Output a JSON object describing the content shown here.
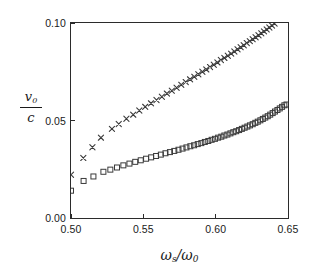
{
  "figure": {
    "background_color": "#ffffff",
    "frame_color": "#2b2b2b",
    "marker_color": "#3a3a3a"
  },
  "axes": {
    "ylabel_numerator": "v",
    "ylabel_numerator_sub": "0",
    "ylabel_denominator": "c",
    "xlabel_numerator": "ω",
    "xlabel_numerator_sub": "s",
    "xlabel_denominator": "ω",
    "xlabel_denominator_sub": "0",
    "xlabel_slash": "/",
    "ytick_labels": [
      "0.00",
      "0.05",
      "0.10"
    ],
    "xtick_labels": [
      "0.50",
      "0.55",
      "0.60",
      "0.65"
    ]
  },
  "chart_data": {
    "type": "scatter",
    "title": "",
    "xlabel": "ω_s/ω_0",
    "ylabel": "v_0/c",
    "xlim": [
      0.5,
      0.65
    ],
    "ylim": [
      0.0,
      0.1
    ],
    "xticks": [
      0.5,
      0.55,
      0.6,
      0.65
    ],
    "yticks": [
      0.0,
      0.05,
      0.1
    ],
    "grid": false,
    "legend": "none",
    "series": [
      {
        "name": "cross-series",
        "marker": "x",
        "points": [
          [
            0.5,
            0.0222
          ],
          [
            0.5085,
            0.0308
          ],
          [
            0.5148,
            0.0363
          ],
          [
            0.5207,
            0.0412
          ],
          [
            0.5283,
            0.0457
          ],
          [
            0.533,
            0.0482
          ],
          [
            0.5383,
            0.0509
          ],
          [
            0.543,
            0.053
          ],
          [
            0.5472,
            0.0551
          ],
          [
            0.5513,
            0.057
          ],
          [
            0.5553,
            0.0588
          ],
          [
            0.5591,
            0.0605
          ],
          [
            0.5628,
            0.0622
          ],
          [
            0.5663,
            0.0638
          ],
          [
            0.5697,
            0.0653
          ],
          [
            0.573,
            0.0668
          ],
          [
            0.5762,
            0.0683
          ],
          [
            0.5793,
            0.0697
          ],
          [
            0.5823,
            0.0711
          ],
          [
            0.5852,
            0.0724
          ],
          [
            0.588,
            0.0737
          ],
          [
            0.5908,
            0.075
          ],
          [
            0.5935,
            0.0762
          ],
          [
            0.5961,
            0.0774
          ],
          [
            0.5987,
            0.0786
          ],
          [
            0.6012,
            0.0798
          ],
          [
            0.6036,
            0.081
          ],
          [
            0.606,
            0.0821
          ],
          [
            0.6084,
            0.0832
          ],
          [
            0.6107,
            0.0843
          ],
          [
            0.6129,
            0.0854
          ],
          [
            0.6151,
            0.0865
          ],
          [
            0.6173,
            0.0876
          ],
          [
            0.6194,
            0.0886
          ],
          [
            0.6215,
            0.0897
          ],
          [
            0.6236,
            0.0907
          ],
          [
            0.6256,
            0.0917
          ],
          [
            0.6276,
            0.0927
          ],
          [
            0.6296,
            0.0937
          ],
          [
            0.6315,
            0.0947
          ],
          [
            0.6334,
            0.0957
          ],
          [
            0.6353,
            0.0967
          ],
          [
            0.6371,
            0.0977
          ],
          [
            0.6389,
            0.0987
          ],
          [
            0.6407,
            0.0997
          ]
        ]
      },
      {
        "name": "square-series",
        "marker": "square",
        "points": [
          [
            0.5,
            0.014
          ],
          [
            0.5087,
            0.019
          ],
          [
            0.5155,
            0.0213
          ],
          [
            0.5224,
            0.0237
          ],
          [
            0.5272,
            0.0248
          ],
          [
            0.5318,
            0.0259
          ],
          [
            0.5362,
            0.027
          ],
          [
            0.5404,
            0.0279
          ],
          [
            0.5444,
            0.0288
          ],
          [
            0.5482,
            0.0296
          ],
          [
            0.5519,
            0.0304
          ],
          [
            0.5554,
            0.0311
          ],
          [
            0.5588,
            0.0318
          ],
          [
            0.5621,
            0.0325
          ],
          [
            0.5653,
            0.0332
          ],
          [
            0.5684,
            0.0338
          ],
          [
            0.5714,
            0.0344
          ],
          [
            0.5743,
            0.035
          ],
          [
            0.5771,
            0.0356
          ],
          [
            0.5798,
            0.0362
          ],
          [
            0.5825,
            0.0368
          ],
          [
            0.5851,
            0.0373
          ],
          [
            0.5876,
            0.0379
          ],
          [
            0.5901,
            0.0384
          ],
          [
            0.5925,
            0.039
          ],
          [
            0.5949,
            0.0395
          ],
          [
            0.5972,
            0.0401
          ],
          [
            0.5995,
            0.0406
          ],
          [
            0.6017,
            0.0412
          ],
          [
            0.6039,
            0.0417
          ],
          [
            0.606,
            0.0423
          ],
          [
            0.6081,
            0.0428
          ],
          [
            0.6102,
            0.0434
          ],
          [
            0.6122,
            0.044
          ],
          [
            0.6142,
            0.0445
          ],
          [
            0.6162,
            0.0451
          ],
          [
            0.6181,
            0.0457
          ],
          [
            0.62,
            0.0463
          ],
          [
            0.6219,
            0.0469
          ],
          [
            0.6237,
            0.0475
          ],
          [
            0.6256,
            0.0481
          ],
          [
            0.6274,
            0.0488
          ],
          [
            0.6291,
            0.0494
          ],
          [
            0.6309,
            0.0501
          ],
          [
            0.6326,
            0.0508
          ],
          [
            0.6343,
            0.0515
          ],
          [
            0.636,
            0.0522
          ],
          [
            0.6377,
            0.053
          ],
          [
            0.6394,
            0.0538
          ],
          [
            0.641,
            0.0546
          ],
          [
            0.6427,
            0.0554
          ],
          [
            0.6443,
            0.0562
          ],
          [
            0.6459,
            0.057
          ],
          [
            0.6475,
            0.0578
          ],
          [
            0.649,
            0.0582
          ]
        ]
      }
    ]
  }
}
